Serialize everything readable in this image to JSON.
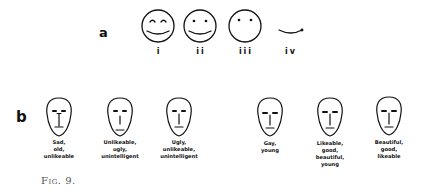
{
  "figure": {
    "caption": "Fig. 9.",
    "panel_a": {
      "label": "a",
      "faces": [
        {
          "id": "i",
          "label": "i",
          "features": "curved-arc eyes, wide smile, circle outline"
        },
        {
          "id": "ii",
          "label": "ii",
          "features": "dot eyes, wide smile, circle outline"
        },
        {
          "id": "iii",
          "label": "iii",
          "features": "dot eyes, no mouth, circle outline"
        },
        {
          "id": "iv",
          "label": "iv",
          "features": "smile curve only, no outline"
        }
      ]
    },
    "panel_b": {
      "label": "b",
      "faces": [
        {
          "id": "b1",
          "description_lines": [
            "Sad,",
            "old,",
            "unlikeable"
          ]
        },
        {
          "id": "b2",
          "description_lines": [
            "Unlikeable,",
            "ugly,",
            "unintelligent"
          ]
        },
        {
          "id": "b3",
          "description_lines": [
            "Ugly,",
            "unlikeable,",
            "unintelligent"
          ]
        },
        {
          "id": "b4",
          "description_lines": [
            "Gay,",
            "young"
          ]
        },
        {
          "id": "b5",
          "description_lines": [
            "Likeable,",
            "good,",
            "beautiful,",
            "young"
          ]
        },
        {
          "id": "b6",
          "description_lines": [
            "Beautiful,",
            "good,",
            "likeable"
          ]
        }
      ]
    }
  },
  "colors": {
    "ink": "#111111",
    "caption": "#555555",
    "background": "#ffffff"
  }
}
